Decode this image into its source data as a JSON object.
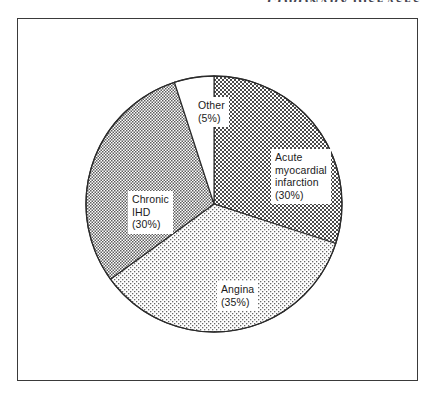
{
  "running_header": "CORONARY DISEASES",
  "figure": {
    "frame_color": "#3a3a3a",
    "background": "#ffffff"
  },
  "chart_data": {
    "type": "pie",
    "title": "",
    "subtitle": "",
    "xlabel": "",
    "ylabel": "",
    "legend_position": "inside-wedges",
    "grid": false,
    "start_angle_deg": 0,
    "direction": "clockwise",
    "center": {
      "x": 213,
      "y": 203
    },
    "radius": 128,
    "total_percent": 100,
    "categories": [
      "Acute myocardial infarction",
      "Angina",
      "Chronic IHD",
      "Other"
    ],
    "values": [
      30,
      35,
      30,
      5
    ],
    "slices": [
      {
        "name": "Acute myocardial infarction",
        "label": "Acute\nmyocardial\ninfarction\n(30%)",
        "value": 30,
        "percent_text": "(30%)",
        "start_deg": 0,
        "end_deg": 108,
        "fill_pattern": "dark-checkerboard",
        "fill_color": "#6d6d6d"
      },
      {
        "name": "Angina",
        "label": "Angina\n(35%)",
        "value": 35,
        "percent_text": "(35%)",
        "start_deg": 108,
        "end_deg": 234,
        "fill_pattern": "light-stipple",
        "fill_color": "#d8d8d8"
      },
      {
        "name": "Chronic IHD",
        "label": "Chronic\nIHD\n(30%)",
        "value": 30,
        "percent_text": "(30%)",
        "start_deg": 234,
        "end_deg": 342,
        "fill_pattern": "medium-crosshatch",
        "fill_color": "#bcbcbc"
      },
      {
        "name": "Other",
        "label": "Other\n(5%)",
        "value": 5,
        "percent_text": "(5%)",
        "start_deg": 342,
        "end_deg": 360,
        "fill_pattern": "none",
        "fill_color": "#ffffff"
      }
    ]
  }
}
